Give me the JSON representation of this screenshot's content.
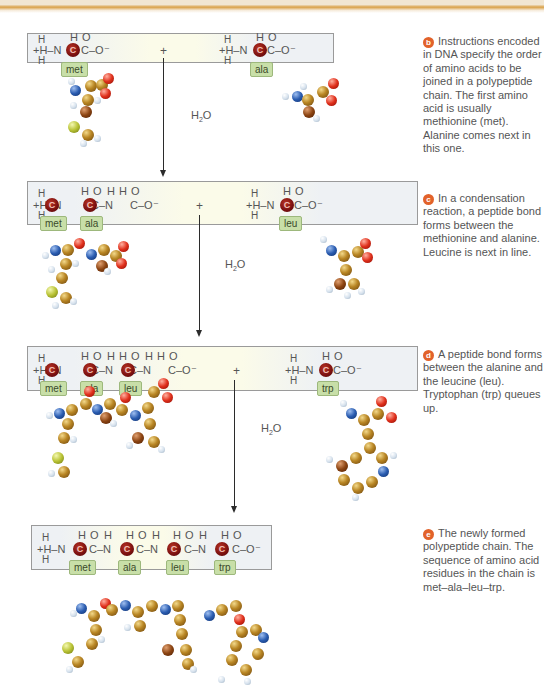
{
  "figure": {
    "steps": [
      {
        "id": "b",
        "caption": "Instructions encoded in DNA specify the order of amino acids to be joined in a polypeptide chain. The first amino acid is usually methionine (met). Alanine comes next in this one.",
        "left_molecule": {
          "residues": [
            "met"
          ]
        },
        "right_molecule": {
          "residues": [
            "ala"
          ]
        },
        "operator": "+",
        "byproduct": "H2O"
      },
      {
        "id": "c",
        "caption": "In a condensation reaction, a peptide bond forms between the methionine and alanine. Leucine is next in line.",
        "left_molecule": {
          "residues": [
            "met",
            "ala"
          ]
        },
        "right_molecule": {
          "residues": [
            "leu"
          ]
        },
        "operator": "+",
        "byproduct": "H2O"
      },
      {
        "id": "d",
        "caption": "A peptide bond forms between the alanine and the leucine (leu). Tryptophan (trp) queues up.",
        "left_molecule": {
          "residues": [
            "met",
            "ala",
            "leu"
          ]
        },
        "right_molecule": {
          "residues": [
            "trp"
          ]
        },
        "operator": "+",
        "byproduct": "H2O"
      },
      {
        "id": "e",
        "caption": "The newly formed polypeptide chain. The sequence of amino acid residues in the chain is met–ala–leu–trp.",
        "left_molecule": {
          "residues": [
            "met",
            "ala",
            "leu",
            "trp"
          ]
        }
      }
    ],
    "labels": {
      "alpha_carbon": "C",
      "amine_group": "+H–N",
      "carboxyl_end": "C–O⁻",
      "hydrogen": "H",
      "oxygen": "O",
      "water": "H",
      "water_sub": "2",
      "water_o": "O"
    },
    "colors": {
      "badge": "#e2622a",
      "alpha_carbon": "#7a1010",
      "residue_tag": "#c8dfa8",
      "panel_border": "#9a9a9a",
      "carbon_atom": "#b98624",
      "nitrogen_atom": "#2a5cb0",
      "oxygen_atom": "#e0301c",
      "sulfur_atom": "#b8c234",
      "hydrogen_atom": "#d4e0ec"
    }
  }
}
